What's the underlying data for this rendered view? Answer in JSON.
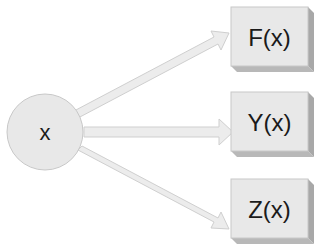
{
  "diagram": {
    "source_node": {
      "label": "x",
      "shape": "circle"
    },
    "target_nodes": [
      {
        "label": "F(x)",
        "shape": "3d-box"
      },
      {
        "label": "Y(x)",
        "shape": "3d-box"
      },
      {
        "label": "Z(x)",
        "shape": "3d-box"
      }
    ],
    "edges": [
      {
        "from": "x",
        "to": "F(x)"
      },
      {
        "from": "x",
        "to": "Y(x)"
      },
      {
        "from": "x",
        "to": "Z(x)"
      }
    ],
    "colors": {
      "node_fill": "#e8e8e8",
      "node_stroke": "#c8c8c8",
      "box_side": "#a8a8a8",
      "box_bottom": "#b8b8b8",
      "arrow_fill": "#ececec",
      "arrow_stroke": "#cfcfcf",
      "text": "#1a1a1a"
    }
  }
}
